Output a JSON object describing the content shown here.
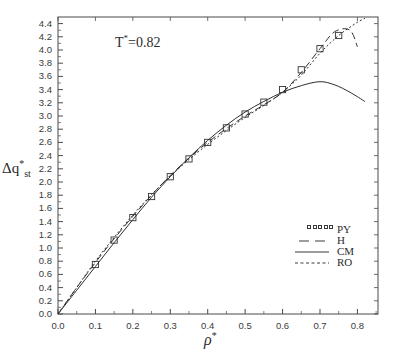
{
  "figure": {
    "annotation": "T*=0.82",
    "annotation_base": "T",
    "annotation_rest": "=0.82",
    "xlabel_symbol": "ρ",
    "ylabel_delta": "Δq",
    "ylabel_sub": "st",
    "star": "*"
  },
  "axes": {
    "x_ticks": [
      "0.0",
      "0.1",
      "0.2",
      "0.3",
      "0.4",
      "0.5",
      "0.6",
      "0.7",
      "0.8"
    ],
    "x_tick_values": [
      0.0,
      0.1,
      0.2,
      0.3,
      0.4,
      0.5,
      0.6,
      0.7,
      0.8
    ],
    "y_ticks": [
      "0.0",
      "0.2",
      "0.4",
      "0.6",
      "0.8",
      "1.0",
      "1.2",
      "1.4",
      "1.6",
      "1.8",
      "2.0",
      "2.2",
      "2.4",
      "2.6",
      "2.8",
      "3.0",
      "3.2",
      "3.4",
      "3.6",
      "3.8",
      "4.0",
      "4.2",
      "4.4"
    ],
    "y_tick_values": [
      0.0,
      0.2,
      0.4,
      0.6,
      0.8,
      1.0,
      1.2,
      1.4,
      1.6,
      1.8,
      2.0,
      2.2,
      2.4,
      2.6,
      2.8,
      3.0,
      3.2,
      3.4,
      3.6,
      3.8,
      4.0,
      4.2,
      4.4
    ],
    "xlim": [
      0.0,
      0.855
    ],
    "ylim": [
      0.0,
      4.5
    ],
    "grid": false,
    "frame_color": "#4a4a4a"
  },
  "legend": {
    "position": "lower-right-inside",
    "entries": [
      {
        "label": "PY",
        "style": "open-squares"
      },
      {
        "label": "H",
        "style": "dashed"
      },
      {
        "label": "CM",
        "style": "solid"
      },
      {
        "label": "RO",
        "style": "dotted"
      }
    ]
  },
  "chart_data": {
    "type": "line",
    "title": "",
    "subtitle": "",
    "annotation": "T*=0.82",
    "xlabel": "ρ*",
    "ylabel": "Δq*_st",
    "xlim": [
      0.0,
      0.855
    ],
    "ylim": [
      0.0,
      4.5
    ],
    "grid": false,
    "legend_position": "lower right (inside axes)",
    "series": [
      {
        "name": "PY",
        "style": "open-squares",
        "marker": "square",
        "x": [
          0.0,
          0.1,
          0.15,
          0.2,
          0.25,
          0.3,
          0.35,
          0.4,
          0.45,
          0.5,
          0.55,
          0.6,
          0.65,
          0.7,
          0.75
        ],
        "y": [
          0.0,
          0.75,
          1.12,
          1.46,
          1.78,
          2.08,
          2.35,
          2.6,
          2.82,
          3.03,
          3.21,
          3.4,
          3.7,
          4.02,
          4.22
        ]
      },
      {
        "name": "H",
        "style": "dashed",
        "x": [
          0.0,
          0.05,
          0.1,
          0.15,
          0.2,
          0.25,
          0.3,
          0.35,
          0.4,
          0.45,
          0.5,
          0.55,
          0.6,
          0.65,
          0.7,
          0.74,
          0.78,
          0.8
        ],
        "y": [
          0.0,
          0.4,
          0.78,
          1.14,
          1.48,
          1.8,
          2.1,
          2.36,
          2.6,
          2.81,
          3.0,
          3.17,
          3.36,
          3.66,
          4.02,
          4.28,
          4.3,
          4.05
        ]
      },
      {
        "name": "CM",
        "style": "solid",
        "x": [
          0.0,
          0.05,
          0.1,
          0.15,
          0.2,
          0.25,
          0.3,
          0.35,
          0.4,
          0.45,
          0.5,
          0.55,
          0.6,
          0.65,
          0.7,
          0.74,
          0.78,
          0.82
        ],
        "y": [
          0.0,
          0.36,
          0.72,
          1.08,
          1.43,
          1.77,
          2.08,
          2.37,
          2.63,
          2.86,
          3.06,
          3.22,
          3.36,
          3.46,
          3.52,
          3.47,
          3.36,
          3.22
        ]
      },
      {
        "name": "RO",
        "style": "dotted",
        "x": [
          0.0,
          0.05,
          0.1,
          0.15,
          0.2,
          0.25,
          0.3,
          0.35,
          0.4,
          0.45,
          0.5,
          0.55,
          0.6,
          0.65,
          0.7,
          0.75,
          0.8,
          0.82
        ],
        "y": [
          0.0,
          0.4,
          0.8,
          1.16,
          1.5,
          1.81,
          2.09,
          2.34,
          2.57,
          2.78,
          2.98,
          3.16,
          3.36,
          3.62,
          3.95,
          4.22,
          4.42,
          4.48
        ]
      }
    ]
  }
}
